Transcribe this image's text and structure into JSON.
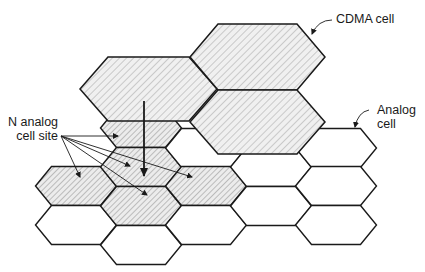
{
  "diagram": {
    "type": "cellular-overlay",
    "colors": {
      "stroke": "#1a1a1a",
      "hatch_fill": "#e8e8e8",
      "hatch_line": "#8a8a8a",
      "background": "#ffffff"
    },
    "labels": {
      "cdma_cell": "CDMA cell",
      "analog_cell_line1": "Analog",
      "analog_cell_line2": "cell",
      "n_analog_line1": "N analog",
      "n_analog_line2": "cell site"
    },
    "cdma_cells": [
      {
        "id": "cdma-upper-left",
        "cx": 148.5,
        "cy": 89,
        "w": 137,
        "h": 64
      },
      {
        "id": "cdma-top-right",
        "cx": 257.5,
        "cy": 57,
        "w": 135,
        "h": 66
      },
      {
        "id": "cdma-lower-right",
        "cx": 257.5,
        "cy": 122,
        "w": 135,
        "h": 64
      }
    ],
    "analog_cells": [
      {
        "col": 1,
        "cx": 76,
        "cy": 186,
        "shaded": true
      },
      {
        "col": 1,
        "cx": 76,
        "cy": 225,
        "shaded": false
      },
      {
        "col": 2,
        "cx": 141,
        "cy": 128,
        "shaded": true
      },
      {
        "col": 2,
        "cx": 141,
        "cy": 167,
        "shaded": true
      },
      {
        "col": 2,
        "cx": 141,
        "cy": 206,
        "shaded": true
      },
      {
        "col": 2,
        "cx": 141,
        "cy": 245,
        "shaded": false
      },
      {
        "col": 3,
        "cx": 206,
        "cy": 148,
        "shaded": false
      },
      {
        "col": 3,
        "cx": 206,
        "cy": 186,
        "shaded": true
      },
      {
        "col": 3,
        "cx": 206,
        "cy": 225,
        "shaded": false
      },
      {
        "col": 4,
        "cx": 271,
        "cy": 167,
        "shaded": false
      },
      {
        "col": 4,
        "cx": 271,
        "cy": 206,
        "shaded": false
      },
      {
        "col": 5,
        "cx": 336,
        "cy": 148,
        "shaded": false
      },
      {
        "col": 5,
        "cx": 336,
        "cy": 186,
        "shaded": false
      },
      {
        "col": 5,
        "cx": 336,
        "cy": 225,
        "shaded": false
      }
    ],
    "n_analog_arrows": {
      "origin": [
        61,
        136
      ],
      "targets": [
        [
          118,
          136
        ],
        [
          80,
          177
        ],
        [
          130,
          166
        ],
        [
          147,
          195
        ],
        [
          192,
          177
        ]
      ]
    },
    "main_arrow": {
      "from": [
        144,
        101
      ],
      "to": [
        144,
        176
      ]
    }
  }
}
